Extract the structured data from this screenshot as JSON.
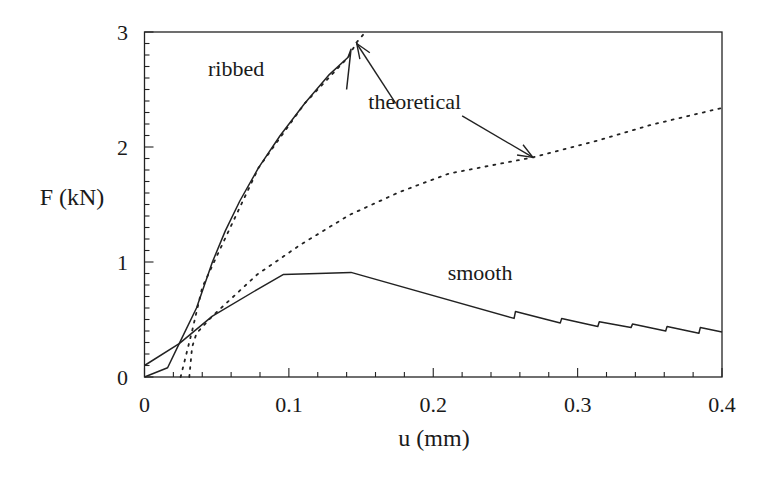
{
  "chart_data": {
    "type": "line",
    "title": "",
    "xlabel": "u (mm)",
    "ylabel": "F (kN)",
    "xlim": [
      0,
      0.4
    ],
    "ylim": [
      0,
      3
    ],
    "grid": false,
    "legend": null,
    "x_ticks": [
      {
        "value": 0,
        "label": "0"
      },
      {
        "value": 0.1,
        "label": "0.1"
      },
      {
        "value": 0.2,
        "label": "0.2"
      },
      {
        "value": 0.3,
        "label": "0.3"
      },
      {
        "value": 0.4,
        "label": "0.4"
      }
    ],
    "x_minor_step": 0.02,
    "y_ticks": [
      {
        "value": 0,
        "label": "0"
      },
      {
        "value": 1,
        "label": "1"
      },
      {
        "value": 2,
        "label": "2"
      },
      {
        "value": 3,
        "label": "3"
      }
    ],
    "y_minor_step": 0.1,
    "series": [
      {
        "name": "ribbed",
        "style": "solid",
        "points": [
          [
            0.0,
            0.0
          ],
          [
            0.016,
            0.08
          ],
          [
            0.024,
            0.29
          ],
          [
            0.036,
            0.6
          ],
          [
            0.047,
            1.0
          ],
          [
            0.056,
            1.27
          ],
          [
            0.066,
            1.53
          ],
          [
            0.079,
            1.82
          ],
          [
            0.094,
            2.1
          ],
          [
            0.111,
            2.38
          ],
          [
            0.128,
            2.63
          ],
          [
            0.141,
            2.78
          ],
          [
            0.143,
            2.85
          ],
          [
            0.14,
            2.5
          ]
        ]
      },
      {
        "name": "smooth",
        "style": "solid",
        "points": [
          [
            0.0,
            0.1
          ],
          [
            0.024,
            0.29
          ],
          [
            0.047,
            0.53
          ],
          [
            0.078,
            0.76
          ],
          [
            0.096,
            0.89
          ],
          [
            0.12,
            0.9
          ],
          [
            0.143,
            0.91
          ],
          [
            0.256,
            0.51
          ],
          [
            0.257,
            0.57
          ],
          [
            0.288,
            0.47
          ],
          [
            0.289,
            0.51
          ],
          [
            0.314,
            0.44
          ],
          [
            0.315,
            0.48
          ],
          [
            0.337,
            0.43
          ],
          [
            0.338,
            0.46
          ],
          [
            0.361,
            0.4
          ],
          [
            0.362,
            0.44
          ],
          [
            0.384,
            0.38
          ],
          [
            0.385,
            0.43
          ],
          [
            0.4,
            0.39
          ]
        ]
      },
      {
        "name": "theoretical (ribbed)",
        "style": "dotted",
        "points": [
          [
            0.025,
            0.0
          ],
          [
            0.033,
            0.4
          ],
          [
            0.04,
            0.78
          ],
          [
            0.05,
            1.05
          ],
          [
            0.079,
            1.82
          ],
          [
            0.111,
            2.38
          ],
          [
            0.141,
            2.78
          ],
          [
            0.147,
            2.91
          ],
          [
            0.153,
            3.0
          ]
        ]
      },
      {
        "name": "theoretical (smooth)",
        "style": "dotted",
        "points": [
          [
            0.031,
            0.0
          ],
          [
            0.033,
            0.26
          ],
          [
            0.036,
            0.38
          ],
          [
            0.047,
            0.53
          ],
          [
            0.078,
            0.89
          ],
          [
            0.108,
            1.15
          ],
          [
            0.142,
            1.41
          ],
          [
            0.177,
            1.61
          ],
          [
            0.211,
            1.77
          ],
          [
            0.269,
            1.91
          ],
          [
            0.315,
            2.06
          ],
          [
            0.35,
            2.19
          ],
          [
            0.4,
            2.34
          ]
        ]
      }
    ],
    "annotations": [
      {
        "text": "ribbed",
        "x": 0.044,
        "y": 2.62
      },
      {
        "text": "theoretical",
        "x": 0.155,
        "y": 2.33
      },
      {
        "text": "smooth",
        "x": 0.21,
        "y": 0.84
      }
    ],
    "arrows": [
      {
        "from": [
          0.174,
          2.38
        ],
        "to": [
          0.147,
          2.9
        ]
      },
      {
        "from": [
          0.22,
          2.27
        ],
        "to": [
          0.269,
          1.91
        ]
      }
    ]
  }
}
